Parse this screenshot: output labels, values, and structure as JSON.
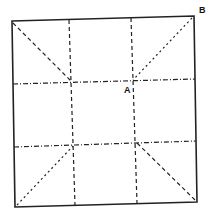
{
  "diagram": {
    "labels": {
      "point_a": "A",
      "point_b": "B"
    },
    "colors": {
      "line": "#222222",
      "background": "#ffffff"
    }
  }
}
